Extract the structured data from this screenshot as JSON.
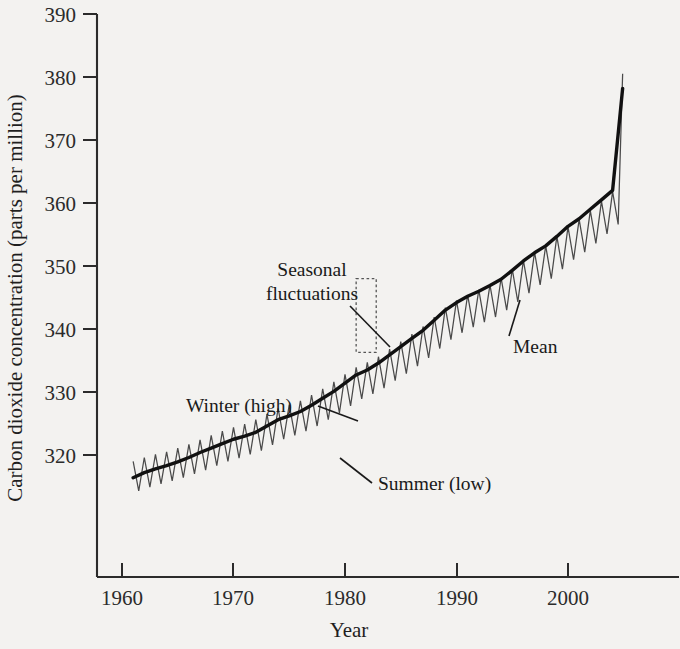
{
  "chart_data": {
    "type": "line",
    "title": "",
    "xlabel": "Year",
    "ylabel": "Carbon dioxide concentration (parts per million)",
    "xlim": [
      1959.0,
      2006.0
    ],
    "ylim": [
      313.0,
      390.0
    ],
    "xticks": [
      1960,
      1970,
      1980,
      1990,
      2000
    ],
    "xtick_labels": [
      "1960",
      "1970",
      "1980",
      "1990",
      "2000"
    ],
    "yticks": [
      320,
      330,
      340,
      350,
      360,
      370,
      380,
      390
    ],
    "ytick_labels": [
      "320",
      "330",
      "340",
      "350",
      "360",
      "370",
      "380",
      "390"
    ],
    "grid": false,
    "legend_position": "none",
    "series": [
      {
        "name": "Seasonal fluctuations",
        "style": "thin-sawtooth",
        "color": "#4a4a4a",
        "description": "Monthly CO2 record showing annual saw-tooth cycle, winter high and summer low, amplitude about 3 ppm peak-to-mean.",
        "x": [
          1961.0,
          1961.5,
          1962.0,
          1962.5,
          1963.0,
          1963.5,
          1964.0,
          1964.5,
          1965.0,
          1965.5,
          1966.0,
          1966.5,
          1967.0,
          1967.5,
          1968.0,
          1968.5,
          1969.0,
          1969.5,
          1970.0,
          1970.5,
          1971.0,
          1971.5,
          1972.0,
          1972.5,
          1973.0,
          1973.5,
          1974.0,
          1974.5,
          1975.0,
          1975.5,
          1976.0,
          1976.5,
          1977.0,
          1977.5,
          1978.0,
          1978.5,
          1979.0,
          1979.5,
          1980.0,
          1980.5,
          1981.0,
          1981.5,
          1982.0,
          1982.5,
          1983.0,
          1983.5,
          1984.0,
          1984.5,
          1985.0,
          1985.5,
          1986.0,
          1986.5,
          1987.0,
          1987.5,
          1988.0,
          1988.5,
          1989.0,
          1989.5,
          1990.0,
          1990.5,
          1991.0,
          1991.5,
          1992.0,
          1992.5,
          1993.0,
          1993.5,
          1994.0,
          1994.5,
          1995.0,
          1995.5,
          1996.0,
          1996.5,
          1997.0,
          1997.5,
          1998.0,
          1998.5,
          1999.0,
          1999.5,
          2000.0,
          2000.5,
          2001.0,
          2001.5,
          2002.0,
          2002.5,
          2003.0,
          2003.5,
          2004.0,
          2004.5,
          2004.9
        ],
        "y": [
          319.0,
          314.3,
          319.6,
          314.9,
          320.1,
          315.4,
          320.5,
          315.9,
          321.1,
          316.4,
          321.7,
          317.0,
          322.4,
          317.6,
          323.1,
          318.3,
          323.8,
          319.0,
          324.4,
          319.5,
          324.9,
          320.1,
          325.6,
          320.7,
          326.5,
          321.6,
          327.4,
          322.5,
          328.0,
          323.1,
          328.6,
          323.8,
          329.5,
          324.6,
          330.5,
          325.6,
          331.6,
          326.7,
          332.8,
          327.8,
          333.9,
          328.9,
          334.7,
          329.7,
          335.6,
          330.6,
          336.8,
          331.8,
          338.0,
          332.9,
          339.2,
          334.1,
          340.4,
          335.4,
          341.9,
          336.9,
          343.4,
          338.3,
          344.5,
          339.4,
          345.4,
          340.3,
          346.2,
          341.1,
          347.0,
          341.9,
          348.1,
          343.0,
          349.5,
          344.3,
          350.9,
          345.7,
          352.2,
          347.0,
          353.2,
          348.0,
          354.7,
          349.5,
          356.2,
          351.0,
          357.4,
          352.2,
          358.8,
          353.6,
          360.3,
          355.1,
          361.8,
          356.6,
          380.5
        ]
      },
      {
        "name": "Mean",
        "style": "thick-smooth",
        "color": "#111111",
        "description": "Smoothed annual mean CO2 trend line.",
        "x": [
          1961,
          1962,
          1963,
          1964,
          1965,
          1966,
          1967,
          1968,
          1969,
          1970,
          1971,
          1972,
          1973,
          1974,
          1975,
          1976,
          1977,
          1978,
          1979,
          1980,
          1981,
          1982,
          1983,
          1984,
          1985,
          1986,
          1987,
          1988,
          1989,
          1990,
          1991,
          1992,
          1993,
          1994,
          1995,
          1996,
          1997,
          1998,
          1999,
          2000,
          2001,
          2002,
          2003,
          2004,
          2004.9
        ],
        "y": [
          316.4,
          317.2,
          317.8,
          318.3,
          318.9,
          319.6,
          320.4,
          321.1,
          321.8,
          322.5,
          323.0,
          323.6,
          324.6,
          325.6,
          326.2,
          326.9,
          327.9,
          329.0,
          330.1,
          331.4,
          332.7,
          333.5,
          334.6,
          335.9,
          337.2,
          338.5,
          339.8,
          341.4,
          343.0,
          344.2,
          345.2,
          346.0,
          346.9,
          347.9,
          349.3,
          350.8,
          352.1,
          353.2,
          354.7,
          356.3,
          357.5,
          359.0,
          360.5,
          362.0,
          378.2
        ]
      }
    ],
    "annotations": [
      {
        "name": "seasonal-fluctuations",
        "text_line1": "Seasonal",
        "text_line2": "fluctuations",
        "target": "dotted highlight box around one annual cycle near 1981-1983"
      },
      {
        "name": "winter-high",
        "text": "Winter (high)",
        "target": "upper peak of saw-tooth near 1978"
      },
      {
        "name": "summer-low",
        "text": "Summer (low)",
        "target": "lower trough of saw-tooth near 1979"
      },
      {
        "name": "mean",
        "text": "Mean",
        "target": "thick smoothed trend line near 1993"
      }
    ],
    "highlight_box": {
      "x_start": 1981.0,
      "x_end": 1982.8,
      "y_bottom": 336.3,
      "y_top": 348.0
    }
  },
  "colors": {
    "background": "#f3f2f0",
    "axis": "#2b2b2b",
    "mean_line": "#111111",
    "seasonal_line": "#4a4a4a",
    "annotation_text": "#1a1a1a"
  }
}
